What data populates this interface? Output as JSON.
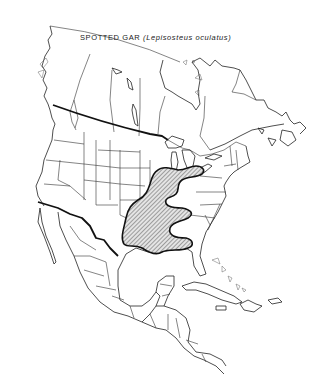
{
  "map": {
    "title": {
      "common_name": "SPOTTED GAR",
      "scientific_name": "(Lepisosteus oculatus)"
    },
    "region": "North America",
    "legend": {
      "range_fill": "diagonal hatching",
      "range_description": "Shaded area indicates species range"
    },
    "colors": {
      "background": "#ffffff",
      "lines": "#222222",
      "hatch": "#444444"
    }
  }
}
